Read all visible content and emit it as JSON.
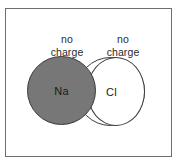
{
  "diagram": {
    "frame": {
      "border_color": "#6e6e6e",
      "background": "#ffffff"
    },
    "labels": [
      {
        "id": "na-charge",
        "text": "no\ncharge"
      },
      {
        "id": "cl-charge",
        "text": "no\ncharge"
      }
    ],
    "atoms": [
      {
        "id": "na",
        "symbol": "Na",
        "fill": "#777777",
        "stroke": "#3a3a3a",
        "charge_label": "no charge"
      },
      {
        "id": "cl",
        "symbol": "Cl",
        "fill": "#ffffff",
        "stroke": "#3a3a3a",
        "charge_label": "no charge"
      }
    ]
  }
}
